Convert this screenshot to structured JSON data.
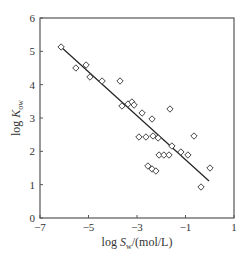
{
  "chart_data": {
    "type": "scatter",
    "title": "",
    "xlabel": "log S_w/(mol/L)",
    "ylabel": "log K_ow",
    "xlabel_parts": {
      "pre": "log ",
      "var": "S",
      "sub": "w",
      "post": "/(mol/L)"
    },
    "ylabel_parts": {
      "pre": "log ",
      "var": "K",
      "sub": "ow"
    },
    "xlim": [
      -7,
      1
    ],
    "ylim": [
      0,
      6
    ],
    "xticks": [
      -7,
      -5,
      -3,
      -1,
      1
    ],
    "xtick_labels": [
      "−7",
      "−5",
      "−3",
      "−1",
      "1"
    ],
    "yticks": [
      0,
      1,
      2,
      3,
      4,
      5,
      6
    ],
    "ytick_labels": [
      "0",
      "1",
      "2",
      "3",
      "4",
      "5",
      "6"
    ],
    "grid": false,
    "legend": null,
    "marker": "diamond-open",
    "series": [
      {
        "name": "data",
        "points": [
          [
            -6.13,
            5.13
          ],
          [
            -5.52,
            4.5
          ],
          [
            -5.1,
            4.59
          ],
          [
            -4.94,
            4.23
          ],
          [
            -4.44,
            4.11
          ],
          [
            -3.7,
            4.11
          ],
          [
            -3.62,
            3.36
          ],
          [
            -3.37,
            3.42
          ],
          [
            -3.21,
            3.48
          ],
          [
            -3.12,
            3.39
          ],
          [
            -2.79,
            3.15
          ],
          [
            -2.38,
            2.97
          ],
          [
            -1.64,
            3.27
          ],
          [
            -2.92,
            2.43
          ],
          [
            -2.63,
            2.43
          ],
          [
            -2.34,
            2.46
          ],
          [
            -2.13,
            2.4
          ],
          [
            -1.56,
            2.16
          ],
          [
            -0.65,
            2.46
          ],
          [
            -2.09,
            1.89
          ],
          [
            -1.89,
            1.89
          ],
          [
            -1.68,
            1.89
          ],
          [
            -1.19,
            1.98
          ],
          [
            -0.9,
            1.89
          ],
          [
            -2.55,
            1.56
          ],
          [
            -2.38,
            1.47
          ],
          [
            -2.22,
            1.41
          ],
          [
            0.01,
            1.5
          ],
          [
            -0.36,
            0.93
          ]
        ]
      }
    ],
    "fit_line": {
      "x": [
        -6.13,
        -0.03
      ],
      "y": [
        5.13,
        1.11
      ]
    }
  },
  "colors": {
    "axis": "#555555",
    "marker": "#444444",
    "line": "#222222",
    "text": "#333333"
  }
}
